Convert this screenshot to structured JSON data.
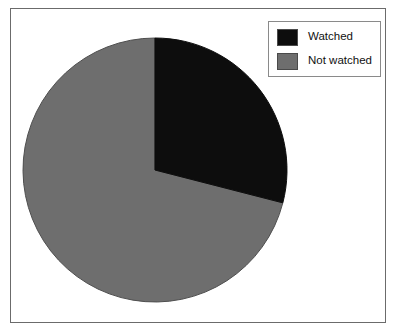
{
  "chart_data": {
    "type": "pie",
    "title": "",
    "categories": [
      "Watched",
      "Not watched"
    ],
    "values": [
      29,
      71
    ],
    "unit": "percent",
    "colors": [
      "#0d0d0d",
      "#6e6e6e"
    ],
    "start_angle_deg": 0,
    "direction": "clockwise",
    "legend_position": "top-right",
    "grid": false,
    "xlabel": "",
    "ylabel": "",
    "slices": [
      {
        "label": "Watched",
        "value": 29,
        "color": "#0d0d0d",
        "start_angle_deg": 0,
        "end_angle_deg": 104
      },
      {
        "label": "Not watched",
        "value": 71,
        "color": "#6e6e6e",
        "start_angle_deg": 104,
        "end_angle_deg": 360
      }
    ]
  },
  "legend": {
    "items": [
      {
        "label": "Watched",
        "color": "#0d0d0d"
      },
      {
        "label": "Not watched",
        "color": "#6e6e6e"
      }
    ]
  },
  "figure": {
    "background": "#ffffff",
    "border_color": "#6b6b6b"
  }
}
